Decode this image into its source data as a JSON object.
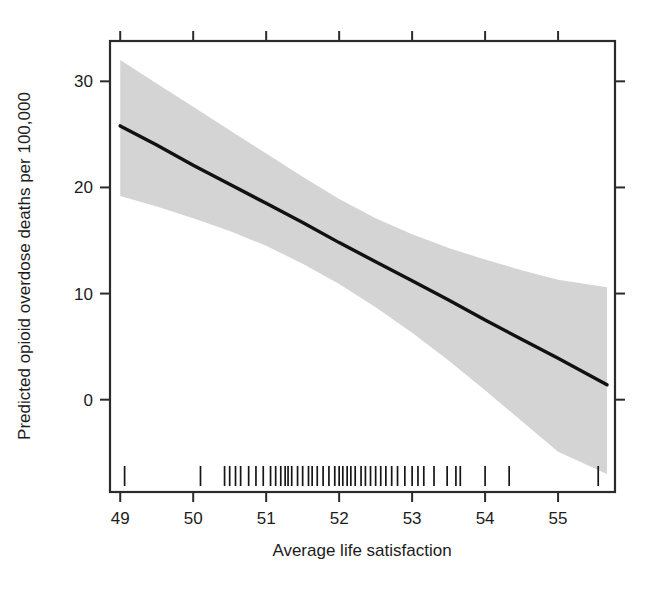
{
  "chart_data": {
    "type": "line",
    "title": "",
    "subtitle": "",
    "xlabel": "Average life satisfaction",
    "ylabel": "Predicted opioid overdose deaths per 100,000",
    "xlim": [
      48.86,
      55.78
    ],
    "ylim": [
      -8.7,
      33.8
    ],
    "xticks": [
      49,
      50,
      51,
      52,
      53,
      54,
      55
    ],
    "xtick_labels": [
      "49",
      "50",
      "51",
      "52",
      "53",
      "54",
      "55"
    ],
    "yticks": [
      0,
      10,
      20,
      30
    ],
    "ytick_labels": [
      "0",
      "10",
      "20",
      "30"
    ],
    "grid": false,
    "legend": "none",
    "axis_box": "full-frame-with-ticks-on-all-four-sides",
    "series": [
      {
        "name": "Predicted opioid overdose deaths (fitted line)",
        "type": "line",
        "color": "#111111",
        "x": [
          49.0,
          49.5,
          50.0,
          50.5,
          51.0,
          51.5,
          52.0,
          52.5,
          53.0,
          53.5,
          54.0,
          54.5,
          55.0,
          55.67
        ],
        "y": [
          25.8,
          24.0,
          22.1,
          20.3,
          18.5,
          16.7,
          14.8,
          13.0,
          11.2,
          9.4,
          7.5,
          5.7,
          3.9,
          1.4
        ]
      },
      {
        "name": "95% confidence band upper",
        "type": "band-upper",
        "color": "#d4d4d4",
        "x": [
          49.0,
          49.5,
          50.0,
          50.5,
          51.0,
          51.5,
          52.0,
          52.5,
          53.0,
          53.5,
          54.0,
          54.5,
          55.0,
          55.67
        ],
        "y": [
          32.0,
          29.8,
          27.6,
          25.4,
          23.2,
          21.0,
          18.9,
          17.1,
          15.6,
          14.3,
          13.2,
          12.2,
          11.3,
          10.6
        ]
      },
      {
        "name": "95% confidence band lower",
        "type": "band-lower",
        "color": "#d4d4d4",
        "x": [
          49.0,
          49.5,
          50.0,
          50.5,
          51.0,
          51.5,
          52.0,
          52.5,
          53.0,
          53.5,
          54.0,
          54.5,
          55.0,
          55.67
        ],
        "y": [
          19.2,
          18.2,
          17.1,
          15.9,
          14.5,
          12.8,
          10.9,
          8.7,
          6.3,
          3.7,
          0.9,
          -2.0,
          -4.9,
          -7.0
        ]
      },
      {
        "name": "rug plot of observed life satisfaction values",
        "type": "rug",
        "color": "#161616",
        "x": [
          49.06,
          50.1,
          50.43,
          50.5,
          50.58,
          50.65,
          50.76,
          50.86,
          50.96,
          51.06,
          51.13,
          51.2,
          51.26,
          51.3,
          51.35,
          51.43,
          51.5,
          51.58,
          51.63,
          51.7,
          51.78,
          51.86,
          51.94,
          52.0,
          52.05,
          52.11,
          52.16,
          52.22,
          52.3,
          52.36,
          52.43,
          52.5,
          52.57,
          52.64,
          52.72,
          52.8,
          52.9,
          53.0,
          53.08,
          53.16,
          53.3,
          53.48,
          53.6,
          53.66,
          54.0,
          54.33,
          55.55
        ]
      }
    ],
    "slope_per_unit": -3.66,
    "n_rug_observations": 47
  },
  "axes": {
    "x_title": "Average life satisfaction",
    "y_title": "Predicted opioid overdose deaths per 100,000"
  }
}
